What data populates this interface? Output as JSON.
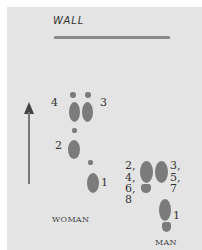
{
  "wall": {
    "label": "WALL"
  },
  "direction": {
    "icon": "arrow-up-icon"
  },
  "woman": {
    "caption": "WOMAN",
    "step_labels": {
      "s1": "1",
      "s2": "2",
      "s3": "3",
      "s4": "4"
    }
  },
  "man": {
    "caption": "MAN",
    "step_labels": {
      "left_group": [
        "2,",
        "4,",
        "6,",
        "8"
      ],
      "right_group": [
        "3,",
        "5,",
        "7"
      ],
      "s1": "1"
    }
  },
  "colors": {
    "background": "#e4e4e4",
    "footprint": "#7b7b7b",
    "wall_line": "#8a8a8a"
  }
}
